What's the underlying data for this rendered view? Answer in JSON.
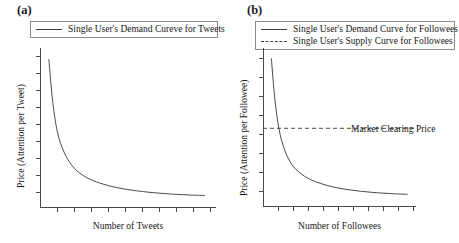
{
  "figure": {
    "background": "#ffffff",
    "line_color": "#404040",
    "axis_color": "#4a4a4a"
  },
  "panels": [
    {
      "tag": "(a)",
      "legend": [
        {
          "label": "Single User's Demand Cureve for Tweets",
          "style": "solid"
        }
      ],
      "ylabel": "Price (Attention per Tweet)",
      "xlabel": "Number of Tweets",
      "annotation": null
    },
    {
      "tag": "(b)",
      "legend": [
        {
          "label": "Single User's Demand Curve for Followees",
          "style": "solid"
        },
        {
          "label": "Single User's  Supply Curve for Followees",
          "style": "dashed"
        }
      ],
      "ylabel": "Price (Attention per Followee)",
      "xlabel": "Number of Followees",
      "annotation": "Market Clearing Price"
    }
  ],
  "chart_data": [
    {
      "type": "line",
      "title": "(a)",
      "xlabel": "Number of Tweets",
      "ylabel": "Price (Attention per Tweet)",
      "xlim": [
        0,
        11
      ],
      "ylim": [
        0,
        10
      ],
      "grid": false,
      "legend_position": "top",
      "axis_ticks": {
        "x_count": 11,
        "y_count": 10,
        "labels": false
      },
      "series": [
        {
          "name": "Single User's Demand Cureve for Tweets",
          "style": "solid",
          "x": [
            0.55,
            0.8,
            1.1,
            1.5,
            2.0,
            2.6,
            3.3,
            4.2,
            5.2,
            6.4,
            7.8,
            9.2,
            10.3
          ],
          "y": [
            9.3,
            6.6,
            4.7,
            3.5,
            2.65,
            2.1,
            1.72,
            1.42,
            1.2,
            1.03,
            0.9,
            0.82,
            0.78
          ]
        }
      ]
    },
    {
      "type": "line",
      "title": "(b)",
      "xlabel": "Number of Followees",
      "ylabel": "Price (Attention per Followee)",
      "xlim": [
        0,
        11
      ],
      "ylim": [
        0,
        10
      ],
      "grid": false,
      "legend_position": "top",
      "axis_ticks": {
        "x_count": 11,
        "y_count": 9,
        "labels": false
      },
      "annotations": [
        {
          "text": "Market Clearing Price",
          "x": 6.2,
          "y": 5.25
        }
      ],
      "series": [
        {
          "name": "Single User's Demand Curve for Followees",
          "style": "solid",
          "x": [
            0.6,
            0.85,
            1.15,
            1.55,
            2.05,
            2.65,
            3.35,
            4.25,
            5.25,
            6.45,
            7.85,
            9.25,
            10.4
          ],
          "y": [
            9.35,
            6.8,
            4.9,
            3.6,
            2.7,
            2.15,
            1.75,
            1.45,
            1.22,
            1.05,
            0.92,
            0.84,
            0.8
          ]
        },
        {
          "name": "Single User's  Supply Curve for Followees",
          "style": "dashed",
          "x": [
            0,
            11
          ],
          "y": [
            4.95,
            4.95
          ],
          "note": "Horizontal market clearing price line"
        }
      ]
    }
  ]
}
